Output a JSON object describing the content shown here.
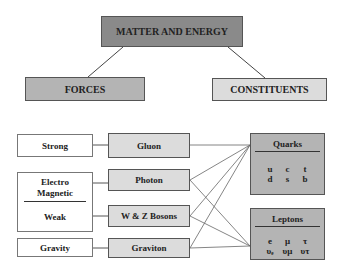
{
  "root": "MATTER AND ENERGY",
  "branches": {
    "forces": "FORCES",
    "constituents": "CONSTITUENTS"
  },
  "forces": {
    "strong": "Strong",
    "electro": "Electro",
    "magnetic": "Magnetic",
    "weak": "Weak",
    "gravity": "Gravity"
  },
  "carriers": {
    "gluon": "Gluon",
    "photon": "Photon",
    "wz": "W & Z Bosons",
    "graviton": "Graviton"
  },
  "quarks": {
    "title": "Quarks",
    "row1": [
      "u",
      "c",
      "t"
    ],
    "row2": [
      "d",
      "s",
      "b"
    ]
  },
  "leptons": {
    "title": "Leptons",
    "row1": [
      "e",
      "μ",
      "τ"
    ],
    "row2": [
      "υₑ",
      "υμ",
      "υτ"
    ]
  },
  "connections": [
    [
      "gluon",
      "quarks"
    ],
    [
      "photon",
      "quarks"
    ],
    [
      "photon",
      "leptons"
    ],
    [
      "wz",
      "quarks"
    ],
    [
      "wz",
      "leptons"
    ],
    [
      "graviton",
      "quarks"
    ],
    [
      "graviton",
      "leptons"
    ]
  ]
}
